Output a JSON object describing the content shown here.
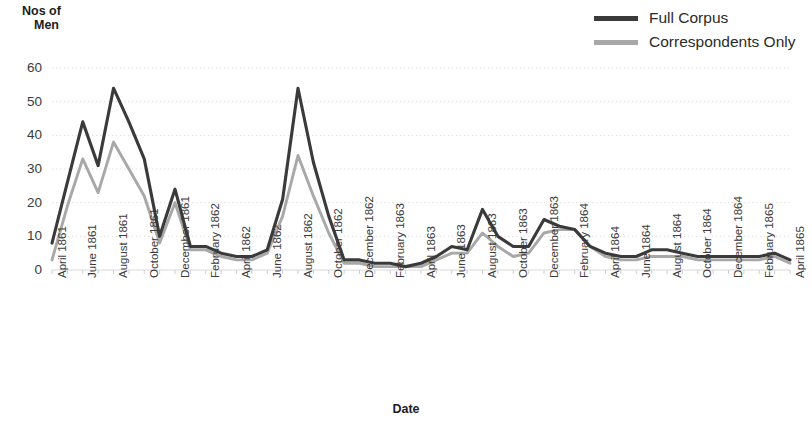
{
  "chart_data": {
    "type": "line",
    "title": "",
    "xlabel": "Date",
    "ylabel": "Nos of Men",
    "ylim": [
      0,
      60
    ],
    "yticks": [
      0,
      10,
      20,
      30,
      40,
      50,
      60
    ],
    "grid": true,
    "legend_position": "top-right",
    "x": [
      "April 1861",
      "May 1861",
      "June 1861",
      "July 1861",
      "August 1861",
      "September 1861",
      "October 1861",
      "November 1861",
      "December 1861",
      "January 1862",
      "February 1862",
      "March 1862",
      "April 1862",
      "May 1862",
      "June 1862",
      "July 1862",
      "August 1862",
      "September 1862",
      "October 1862",
      "November 1862",
      "December 1862",
      "January 1863",
      "February 1863",
      "March 1863",
      "April 1863",
      "May 1863",
      "June 1863",
      "July 1863",
      "August 1863",
      "September 1863",
      "October 1863",
      "November 1863",
      "December 1863",
      "January 1864",
      "February 1864",
      "March 1864",
      "April 1864",
      "May 1864",
      "June 1864",
      "July 1864",
      "August 1864",
      "September 1864",
      "October 1864",
      "November 1864",
      "December 1864",
      "January 1865",
      "February 1865",
      "March 1865",
      "April 1865"
    ],
    "xtick_labels": [
      "April 1861",
      "June 1861",
      "August 1861",
      "October 1861",
      "December 1861",
      "February 1862",
      "April 1862",
      "June 1862",
      "August 1862",
      "October 1862",
      "December 1862",
      "February 1863",
      "April 1863",
      "June 1863",
      "August 1863",
      "October 1863",
      "December 1863",
      "February 1864",
      "April 1864",
      "June 1864",
      "August 1864",
      "October 1864",
      "December 1864",
      "February 1865",
      "April 1865"
    ],
    "series": [
      {
        "name": "Full Corpus",
        "color": "#3a3a3a",
        "values": [
          8,
          26,
          44,
          31,
          54,
          44,
          33,
          10,
          24,
          7,
          7,
          5,
          4,
          4,
          6,
          21,
          54,
          32,
          16,
          3,
          3,
          2,
          2,
          1,
          2,
          4,
          7,
          6,
          18,
          10,
          7,
          7,
          15,
          13,
          12,
          7,
          5,
          4,
          4,
          6,
          6,
          5,
          4,
          4,
          4,
          4,
          4,
          5,
          3
        ]
      },
      {
        "name": "Correspondents Only",
        "color": "#a8a8a8",
        "values": [
          3,
          19,
          33,
          23,
          38,
          30,
          22,
          8,
          20,
          6,
          6,
          4,
          3,
          3,
          5,
          16,
          34,
          22,
          11,
          2,
          2,
          1,
          1,
          1,
          1,
          3,
          5,
          5,
          11,
          7,
          4,
          5,
          11,
          12,
          12,
          7,
          4,
          3,
          3,
          4,
          4,
          4,
          3,
          3,
          3,
          3,
          3,
          4,
          2
        ]
      }
    ]
  },
  "legend": {
    "items": [
      {
        "label": "Full Corpus",
        "color": "#3a3a3a"
      },
      {
        "label": "Correspondents Only",
        "color": "#a8a8a8"
      }
    ]
  },
  "axes": {
    "y_title_line1": "Nos of",
    "y_title_line2": "Men",
    "x_title": "Date"
  }
}
